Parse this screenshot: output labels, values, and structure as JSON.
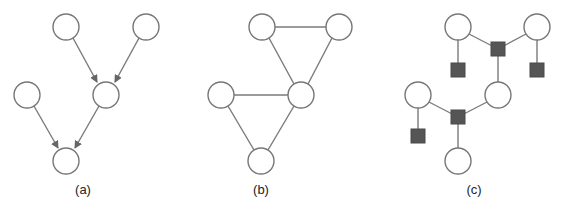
{
  "figure": {
    "panels": [
      {
        "id": "a",
        "caption": "(a)",
        "type": "directed-graph",
        "nodes": [
          {
            "id": "a1",
            "x": 66,
            "y": 27
          },
          {
            "id": "a2",
            "x": 146,
            "y": 27
          },
          {
            "id": "a3",
            "x": 27,
            "y": 95
          },
          {
            "id": "a4",
            "x": 106,
            "y": 95
          },
          {
            "id": "a5",
            "x": 66,
            "y": 161
          }
        ],
        "edges": [
          [
            "a1",
            "a4"
          ],
          [
            "a2",
            "a4"
          ],
          [
            "a3",
            "a5"
          ],
          [
            "a4",
            "a5"
          ]
        ]
      },
      {
        "id": "b",
        "caption": "(b)",
        "type": "undirected-graph",
        "nodes": [
          {
            "id": "b1",
            "x": 262,
            "y": 27
          },
          {
            "id": "b2",
            "x": 339,
            "y": 27
          },
          {
            "id": "b3",
            "x": 221,
            "y": 95
          },
          {
            "id": "b4",
            "x": 301,
            "y": 95
          },
          {
            "id": "b5",
            "x": 261,
            "y": 161
          }
        ],
        "edges": [
          [
            "b1",
            "b2"
          ],
          [
            "b1",
            "b4"
          ],
          [
            "b2",
            "b4"
          ],
          [
            "b3",
            "b4"
          ],
          [
            "b3",
            "b5"
          ],
          [
            "b4",
            "b5"
          ]
        ]
      },
      {
        "id": "c",
        "caption": "(c)",
        "type": "factor-graph",
        "nodes": [
          {
            "id": "c1",
            "x": 458,
            "y": 27
          },
          {
            "id": "c2",
            "x": 537,
            "y": 27
          },
          {
            "id": "c3",
            "x": 418,
            "y": 95
          },
          {
            "id": "c4",
            "x": 498,
            "y": 95
          },
          {
            "id": "c5",
            "x": 458,
            "y": 161
          }
        ],
        "factors": [
          {
            "id": "f1",
            "x": 498,
            "y": 49
          },
          {
            "id": "f2",
            "x": 458,
            "y": 70
          },
          {
            "id": "f3",
            "x": 537,
            "y": 70
          },
          {
            "id": "f4",
            "x": 458,
            "y": 117
          },
          {
            "id": "f5",
            "x": 418,
            "y": 136
          }
        ],
        "edges": [
          [
            "c1",
            "f1"
          ],
          [
            "c2",
            "f1"
          ],
          [
            "f1",
            "c4"
          ],
          [
            "c1",
            "f2"
          ],
          [
            "c2",
            "f3"
          ],
          [
            "c3",
            "f4"
          ],
          [
            "c4",
            "f4"
          ],
          [
            "f4",
            "c5"
          ],
          [
            "c3",
            "f5"
          ]
        ]
      }
    ],
    "colors": {
      "node_stroke": "#777777",
      "edge": "#7a7a7a",
      "factor_fill": "#555555",
      "background": "#ffffff"
    }
  }
}
